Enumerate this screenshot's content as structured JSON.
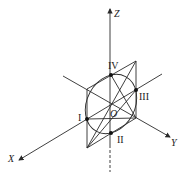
{
  "diagram": {
    "axes": {
      "x": "X",
      "y": "Y",
      "z": "Z",
      "origin": "O"
    },
    "points": [
      {
        "id": "I",
        "label": "I"
      },
      {
        "id": "II",
        "label": "II"
      },
      {
        "id": "III",
        "label": "III"
      },
      {
        "id": "IV",
        "label": "IV"
      }
    ],
    "colors": {
      "stroke": "#2a2a2a",
      "background": "#ffffff"
    }
  }
}
